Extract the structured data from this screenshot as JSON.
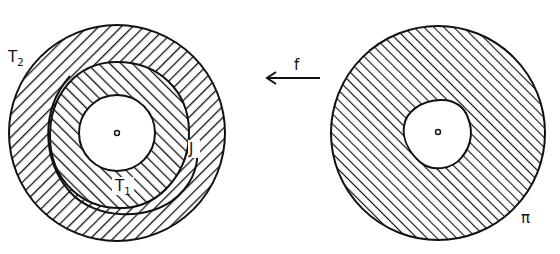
{
  "diagram": {
    "left_figure": {
      "outer_label": "T",
      "outer_label_sub": "2",
      "inner_label": "T",
      "inner_label_sub": "1",
      "curve_label": "J"
    },
    "arrow": {
      "label": "f",
      "direction": "left"
    },
    "right_figure": {
      "label": "π"
    }
  },
  "colors": {
    "ink": "#111111",
    "background": "#ffffff"
  }
}
